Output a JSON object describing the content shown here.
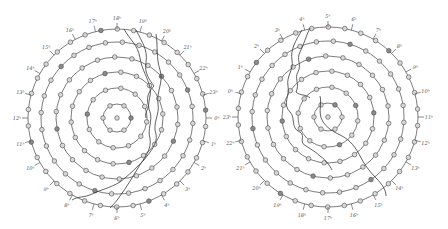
{
  "figure": {
    "panels": [
      {
        "id": "left",
        "center": [
          117,
          118
        ],
        "ring_radii": [
          14,
          30,
          46,
          61,
          76,
          89
        ],
        "dots_per_ring": [
          6,
          12,
          18,
          22,
          28,
          34
        ],
        "center_dot": true,
        "hour_labels": [
          {
            "text": "16ʰ",
            "angle": -118
          },
          {
            "text": "17ʰ",
            "angle": -104
          },
          {
            "text": "18ʰ",
            "angle": -90
          },
          {
            "text": "19ʰ",
            "angle": -75
          },
          {
            "text": "20ʰ",
            "angle": -60
          },
          {
            "text": "21ʰ",
            "angle": -45
          },
          {
            "text": "22ʰ",
            "angle": -30
          },
          {
            "text": "23ʰ",
            "angle": -15
          },
          {
            "text": "0ʰ",
            "angle": 0
          },
          {
            "text": "1ʰ",
            "angle": 15
          },
          {
            "text": "2ʰ",
            "angle": 30
          },
          {
            "text": "3ʰ",
            "angle": 45
          },
          {
            "text": "4ʰ",
            "angle": 60
          },
          {
            "text": "5ʰ",
            "angle": 75
          },
          {
            "text": "6ʰ",
            "angle": 90
          },
          {
            "text": "7ʰ",
            "angle": 105
          },
          {
            "text": "8ʰ",
            "angle": 120
          },
          {
            "text": "9ʰ",
            "angle": 135
          },
          {
            "text": "10ʰ",
            "angle": 150
          },
          {
            "text": "11ʰ",
            "angle": 165
          },
          {
            "text": "12ʰ",
            "angle": 180
          },
          {
            "text": "13ʰ",
            "angle": 195
          },
          {
            "text": "14ʰ",
            "angle": 210
          },
          {
            "text": "15ʰ",
            "angle": 225
          }
        ],
        "boundaries": [
          "M124,29 C130,40 138,45 140,58 C142,70 148,78 150,88 C152,96 146,104 150,112 C153,120 147,130 150,138 C152,150 144,158 138,168 C132,178 126,188 120,196 C116,202 112,206 110,208",
          "M136,30 C142,42 148,50 146,62 C144,74 150,80 154,86 C150,90 146,96 148,104 C150,108 144,112 146,118",
          "M156,34 C158,46 156,58 160,70 C164,82 156,92 158,104 C160,114 152,124 156,134 C158,144 150,152 144,160 C136,168 128,176 120,182 C110,188 100,190 92,194 C84,198 78,196 72,200"
        ]
      },
      {
        "id": "right",
        "center": [
          328,
          117
        ],
        "ring_radii": [
          14,
          30,
          46,
          61,
          76,
          90
        ],
        "dots_per_ring": [
          6,
          12,
          18,
          22,
          28,
          34
        ],
        "center_dot": true,
        "hour_labels": [
          {
            "text": "3ʰ",
            "angle": -120
          },
          {
            "text": "4ʰ",
            "angle": -105
          },
          {
            "text": "5ʰ",
            "angle": -90
          },
          {
            "text": "6ʰ",
            "angle": -75
          },
          {
            "text": "7ʰ",
            "angle": -60
          },
          {
            "text": "8ʰ",
            "angle": -45
          },
          {
            "text": "9ʰ",
            "angle": -30
          },
          {
            "text": "10ʰ",
            "angle": -15
          },
          {
            "text": "11ʰ",
            "angle": 0
          },
          {
            "text": "12ʰ",
            "angle": 15
          },
          {
            "text": "13ʰ",
            "angle": 30
          },
          {
            "text": "14ʰ",
            "angle": 45
          },
          {
            "text": "15ʰ",
            "angle": 60
          },
          {
            "text": "16ʰ",
            "angle": 75
          },
          {
            "text": "17ʰ",
            "angle": 90
          },
          {
            "text": "18ʰ",
            "angle": 105
          },
          {
            "text": "19ʰ",
            "angle": 120
          },
          {
            "text": "20ʰ",
            "angle": 135
          },
          {
            "text": "21ʰ",
            "angle": 150
          },
          {
            "text": "22ʰ",
            "angle": 165
          },
          {
            "text": "23ʰ",
            "angle": 180
          },
          {
            "text": "0ʰ",
            "angle": 195
          },
          {
            "text": "1ʰ",
            "angle": 210
          },
          {
            "text": "2ʰ",
            "angle": 225
          }
        ],
        "boundaries": [
          "M302,30 C296,40 290,50 292,60 C294,70 286,76 288,86 C290,96 282,104 290,112 C296,118 290,128 300,132 C306,136 298,142 306,146 C312,150 316,152 320,156 C326,160 330,166 332,170",
          "M310,28 C306,36 304,44 300,52 C296,60 302,64 298,72 C294,78 300,84 296,92 C300,96 306,94 310,98",
          "M320,96 C322,104 318,112 322,120 C326,128 334,132 342,136 C350,140 356,148 360,156 C364,164 370,172 376,178 C382,184 386,190 386,196"
        ]
      }
    ]
  }
}
